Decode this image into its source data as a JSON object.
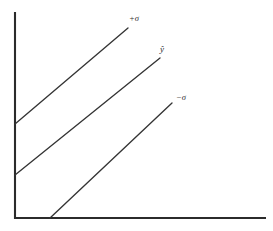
{
  "figure": {
    "background_color": "#ffffff",
    "axis_color": "#2b2b2b",
    "line_color": "#343434",
    "width": 273,
    "height": 231
  },
  "axes": {
    "y_axis_name": "y-axis",
    "x_axis_name": "x-axis",
    "y_axis": {
      "x": 15,
      "y_top": 12,
      "y_bottom": 219
    },
    "x_axis": {
      "y": 218,
      "x_left": 15,
      "x_right": 266
    }
  },
  "labels": {
    "upper": "+σ",
    "middle": "ŷ",
    "lower": "−σ"
  },
  "chart_data": {
    "type": "line",
    "title": "",
    "xlabel": "",
    "ylabel": "",
    "grid": false,
    "legend_position": "inline-end-of-line",
    "axis_ranges": {
      "x": [
        0,
        273
      ],
      "y": [
        0,
        231
      ]
    },
    "note": "Three parallel ascending straight lines representing a fitted regression line with plus and minus one standard deviation bands. Coordinates are in pixel space with y increasing downward.",
    "series": [
      {
        "name": "+σ",
        "label": "+σ",
        "x": [
          15,
          128
        ],
        "y": [
          124,
          28
        ],
        "label_position": {
          "x": 129,
          "y": 14
        }
      },
      {
        "name": "ŷ",
        "label": "ŷ",
        "x": [
          15,
          160
        ],
        "y": [
          175,
          58
        ],
        "label_position": {
          "x": 160,
          "y": 45
        }
      },
      {
        "name": "−σ",
        "label": "−σ",
        "x": [
          50,
          172
        ],
        "y": [
          218,
          103
        ],
        "label_position": {
          "x": 176,
          "y": 93
        }
      }
    ]
  }
}
